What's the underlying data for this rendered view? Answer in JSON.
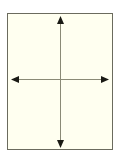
{
  "figure": {
    "title": "",
    "caption": "",
    "frame": {
      "name": "diagram-frame",
      "x": 7,
      "y": 13,
      "width": 106,
      "height": 137,
      "fill_color": "#fffff0",
      "border_color": "#6b6b5e",
      "border_width": 1
    },
    "page_background_color": "#ffffff"
  },
  "chart_data": {
    "type": "diagram",
    "title": "",
    "subtitle": "",
    "xlabel": "",
    "ylabel": "",
    "grid": false,
    "legend": null,
    "annotations": [],
    "tick_labels": {
      "x": [],
      "y": []
    },
    "axis_lines": [
      {
        "name": "vertical-axis",
        "orientation": "vertical",
        "x1": 60.5,
        "y1": 17,
        "x2": 60.5,
        "y2": 147,
        "stroke_color": "#8a8a76",
        "stroke_width": 1,
        "arrow_start": true,
        "arrow_end": true
      },
      {
        "name": "horizontal-axis",
        "orientation": "horizontal",
        "x1": 12,
        "y1": 79.5,
        "x2": 108,
        "y2": 79.5,
        "stroke_color": "#8a8a76",
        "stroke_width": 1,
        "arrow_start": true,
        "arrow_end": true
      }
    ],
    "arrowheads": [
      {
        "name": "arrowhead-up",
        "direction": "up",
        "tip_x": 60.5,
        "tip_y": 16,
        "width": 7,
        "length": 8,
        "fill_color": "#1a1a14"
      },
      {
        "name": "arrowhead-down",
        "direction": "down",
        "tip_x": 60.5,
        "tip_y": 148,
        "width": 7,
        "length": 8,
        "fill_color": "#1a1a14"
      },
      {
        "name": "arrowhead-left",
        "direction": "left",
        "tip_x": 11,
        "tip_y": 79.5,
        "width": 7,
        "length": 8,
        "fill_color": "#1a1a14"
      },
      {
        "name": "arrowhead-right",
        "direction": "right",
        "tip_x": 109,
        "tip_y": 79.5,
        "width": 7,
        "length": 8,
        "fill_color": "#1a1a14"
      }
    ],
    "origin": {
      "x": 60.5,
      "y": 79.5
    }
  }
}
